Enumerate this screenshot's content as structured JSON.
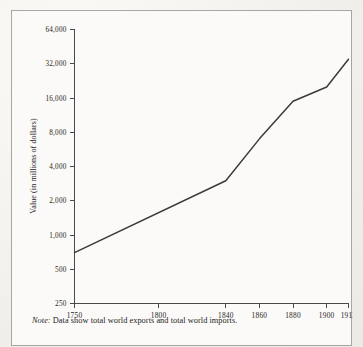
{
  "figure": {
    "note_label": "Note:",
    "note_text": " Data show total world exports and total world imports."
  },
  "chart_data": {
    "type": "line",
    "title": "",
    "xlabel": "",
    "ylabel": "Value (in millions of dollars)",
    "x": [
      1750,
      1840,
      1860,
      1880,
      1900,
      1913
    ],
    "values": [
      700,
      3000,
      7000,
      15000,
      20000,
      35000
    ],
    "series": [
      {
        "name": "World trade (exports and imports)",
        "values": [
          700,
          3000,
          7000,
          15000,
          20000,
          35000
        ]
      }
    ],
    "xtick_labels": [
      "1750",
      "1800",
      "1840",
      "1860",
      "1880",
      "1900",
      "1913"
    ],
    "xtick_values": [
      1750,
      1800,
      1840,
      1860,
      1880,
      1900,
      1913
    ],
    "ytick_labels": [
      "250",
      "500",
      "1,000",
      "2,000",
      "4,000",
      "8,000",
      "16,000",
      "32,000",
      "64,000"
    ],
    "ytick_values": [
      250,
      500,
      1000,
      2000,
      4000,
      8000,
      16000,
      32000,
      64000
    ],
    "yscale": "log2",
    "ylim": [
      250,
      64000
    ],
    "xlim": [
      1750,
      1913
    ],
    "grid": false,
    "legend": "none",
    "line_color": "#3b3b3b",
    "axis_color": "#4a4a4a"
  }
}
